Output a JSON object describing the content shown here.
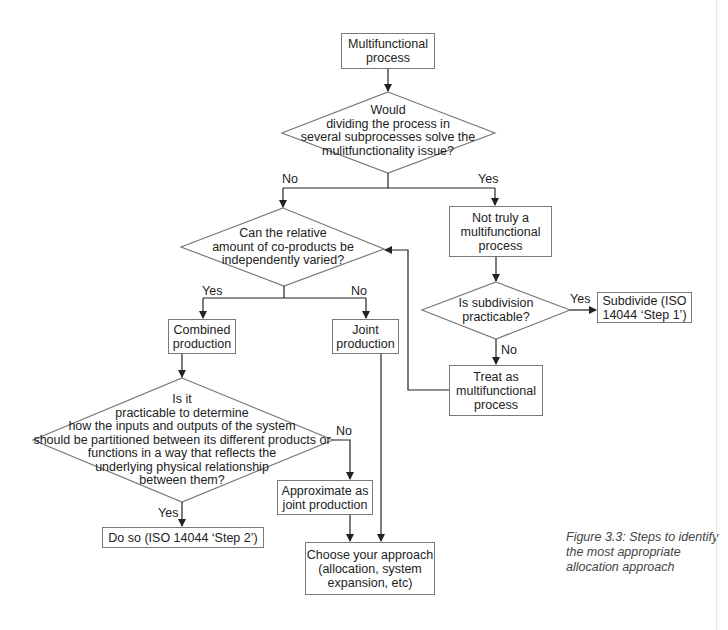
{
  "nodes": {
    "start": {
      "lines": [
        "Multifunctional",
        "process"
      ]
    },
    "q1": {
      "lines": [
        "Would",
        "dividing the process in",
        "several subprocesses solve the",
        "mulitfunctionality issue?"
      ]
    },
    "q2": {
      "lines": [
        "Can the relative",
        "amount of co-products be",
        "independently varied?"
      ]
    },
    "not_truly": {
      "lines": [
        "Not truly a",
        "multifunctional",
        "process"
      ]
    },
    "q3": {
      "lines": [
        "Is subdivision",
        "practicable?"
      ]
    },
    "subdivide": {
      "lines": [
        "Subdivide (ISO",
        "14044 ‘Step 1’)"
      ]
    },
    "treat": {
      "lines": [
        "Treat as",
        "multifunctional",
        "process"
      ]
    },
    "combined": {
      "lines": [
        "Combined",
        "production"
      ]
    },
    "joint": {
      "lines": [
        "Joint",
        "production"
      ]
    },
    "q4": {
      "lines": [
        "Is it",
        "practicable to determine",
        "how the inputs and outputs of the system",
        "should be partitioned between its different products or",
        "functions in a way that reflects the",
        "underlying physical relationship",
        "between them?"
      ]
    },
    "approximate": {
      "lines": [
        "Approximate as",
        "joint production"
      ]
    },
    "do_so": {
      "lines": [
        "Do so (ISO 14044 ‘Step 2’)"
      ]
    },
    "choose": {
      "lines": [
        "Choose your approach",
        "(allocation, system",
        "expansion, etc)"
      ]
    }
  },
  "edge_labels": {
    "q1_no": "No",
    "q1_yes": "Yes",
    "q2_yes": "Yes",
    "q2_no": "No",
    "q3_yes": "Yes",
    "q3_no": "No",
    "q4_no": "No",
    "q4_yes": "Yes"
  },
  "caption": {
    "lines": [
      "Figure 3.3: Steps to identify",
      "the most appropriate",
      "allocation approach"
    ]
  },
  "colors": {
    "line": "#222222",
    "border": "#7a7a7a",
    "text": "#222222",
    "caption": "#444444"
  }
}
